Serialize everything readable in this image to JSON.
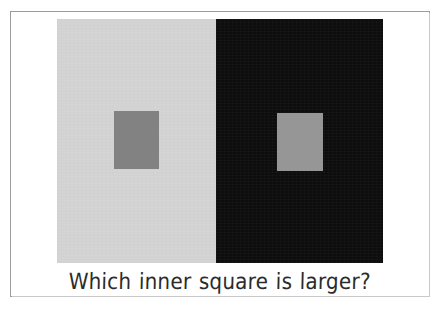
{
  "figure": {
    "name": "simultaneous-contrast-illusion",
    "caption": "Which inner square is larger?",
    "frame": {
      "border_color": "#9c9c9c",
      "background_color": "#ffffff"
    },
    "panels": [
      {
        "id": "light-panel",
        "side": "left",
        "surround_label": "light surround",
        "surround_color": "#d4d4d4",
        "inner_square": {
          "label": "left inner square",
          "color": "#828282",
          "width_px": 45,
          "height_px": 58
        }
      },
      {
        "id": "dark-panel",
        "side": "right",
        "surround_label": "dark surround",
        "surround_color": "#0d0d0d",
        "inner_square": {
          "label": "right inner square",
          "color": "#969696",
          "width_px": 46,
          "height_px": 58
        }
      }
    ]
  }
}
